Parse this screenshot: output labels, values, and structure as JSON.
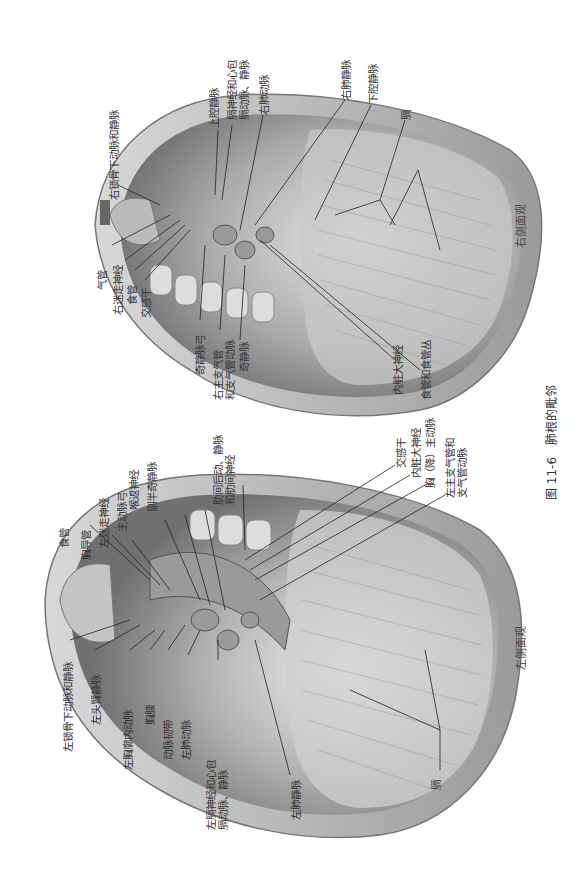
{
  "figure": {
    "number": "图 11-6",
    "title": "肺根的毗邻",
    "orientation": "rotated 90° counter-clockwise"
  },
  "panels": {
    "right_view": {
      "caption": "右侧面观",
      "labels": {
        "r_subclavian": "右锁骨下动脉和静脉",
        "svc": "上腔静脉",
        "phrenic": "膈神经和心包\n膈动脉、静脉",
        "r_pulm_artery": "右肺动脉",
        "r_pulm_vein": "右肺静脉",
        "ivc": "下腔静脉",
        "diaphragm": "膈",
        "trachea": "气管",
        "r_vagus": "右迷走神经",
        "esophagus": "食管",
        "sympathetic": "交感干",
        "azygos_arch": "奇静脉弓",
        "r_bronchus": "右主支气管\n和支气管动脉",
        "azygos": "奇静脉",
        "splanchnic": "内脏大神经",
        "esoph_plexus": "食管和食管丛"
      }
    },
    "left_view": {
      "caption": "左侧面观",
      "labels": {
        "esophagus": "食管",
        "thoracic_duct": "胸导管",
        "l_vagus": "左迷走神经",
        "aortic_arch": "主动脉弓",
        "recurrent": "喉返神经",
        "hemiazygos": "副半奇静脉",
        "intercostal": "肋间后动、静脉\n和肋间神经",
        "sympathetic": "交感干",
        "splanchnic": "内脏大神经",
        "desc_aorta": "胸（降）主动脉",
        "l_bronchus": "左主支气管和\n支气管动脉",
        "l_subclavian": "左锁骨下动脉和静脉",
        "l_brachiocephalic": "左头臂静脉",
        "int_thoracic": "左胸廓内动脉",
        "thymus": "胸腺",
        "lig_arteriosum": "动脉韧带",
        "l_pulm_artery": "左肺动脉",
        "phrenic": "左膈神经和心包\n膈动脉、静脉",
        "l_pulm_vein": "左肺静脉",
        "diaphragm": "膈"
      }
    }
  }
}
